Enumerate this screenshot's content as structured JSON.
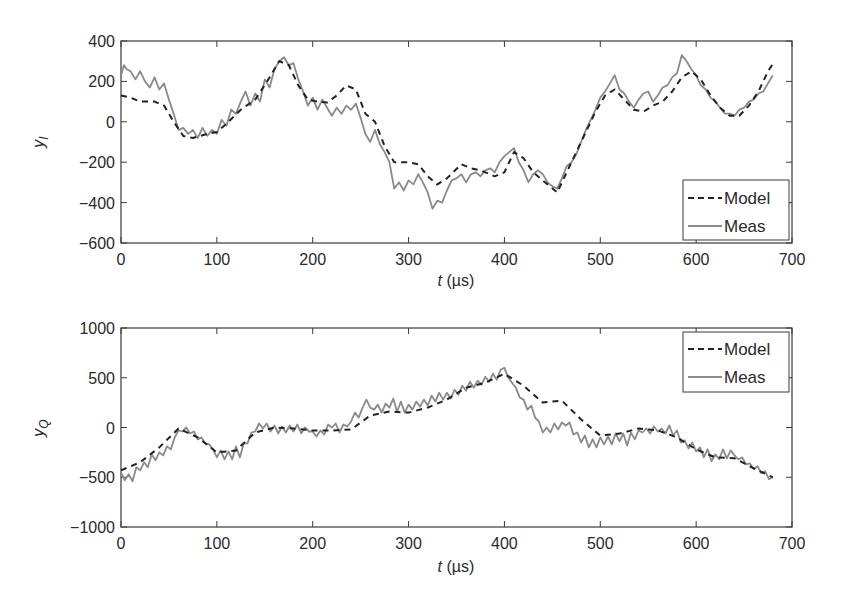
{
  "chart_data": [
    {
      "type": "line",
      "panel": "top",
      "title": "",
      "xlabel": "t (µs)",
      "xlabel_var": "t",
      "xlabel_unit": "(µs)",
      "ylabel": "y_I",
      "ylabel_main": "y",
      "ylabel_sub": "I",
      "xlim": [
        0,
        700
      ],
      "ylim": [
        -600,
        400
      ],
      "xticks": [
        0,
        100,
        200,
        300,
        400,
        500,
        600,
        700
      ],
      "yticks": [
        -600,
        -400,
        -200,
        0,
        200,
        400
      ],
      "xtick_labels": [
        "0",
        "100",
        "200",
        "300",
        "400",
        "500",
        "600",
        "700"
      ],
      "ytick_labels": [
        "−600",
        "−400",
        "−200",
        "0",
        "200",
        "400"
      ],
      "grid": false,
      "legend_position": "lower right",
      "legend": [
        "Model",
        "Meas"
      ],
      "series": [
        {
          "name": "Model",
          "style": "dashed",
          "color": "#222222",
          "x": [
            0,
            10,
            20,
            35,
            45,
            55,
            65,
            75,
            90,
            100,
            110,
            125,
            140,
            155,
            165,
            175,
            185,
            195,
            205,
            215,
            225,
            235,
            245,
            255,
            265,
            275,
            285,
            300,
            310,
            320,
            330,
            340,
            355,
            365,
            375,
            390,
            400,
            410,
            420,
            430,
            440,
            455,
            465,
            475,
            485,
            495,
            505,
            515,
            525,
            535,
            545,
            555,
            565,
            575,
            585,
            595,
            605,
            615,
            625,
            635,
            645,
            655,
            665,
            675,
            682
          ],
          "y": [
            130,
            120,
            100,
            100,
            80,
            0,
            -70,
            -80,
            -60,
            -50,
            -10,
            60,
            110,
            220,
            300,
            280,
            180,
            110,
            100,
            95,
            130,
            180,
            160,
            40,
            0,
            -120,
            -200,
            -200,
            -210,
            -270,
            -310,
            -280,
            -210,
            -230,
            -240,
            -270,
            -250,
            -150,
            -180,
            -250,
            -290,
            -350,
            -250,
            -150,
            -50,
            50,
            130,
            160,
            110,
            60,
            50,
            80,
            100,
            150,
            220,
            250,
            210,
            130,
            70,
            30,
            30,
            80,
            150,
            250,
            300
          ]
        },
        {
          "name": "Meas",
          "style": "solid",
          "color": "#8a8a8a",
          "x": [
            0,
            3,
            6,
            10,
            15,
            20,
            25,
            30,
            35,
            40,
            45,
            50,
            55,
            60,
            65,
            70,
            75,
            80,
            85,
            90,
            95,
            100,
            105,
            110,
            115,
            120,
            125,
            130,
            135,
            140,
            145,
            150,
            155,
            160,
            165,
            170,
            175,
            180,
            185,
            190,
            195,
            200,
            205,
            210,
            215,
            220,
            225,
            230,
            235,
            240,
            245,
            250,
            255,
            260,
            265,
            270,
            275,
            280,
            285,
            290,
            295,
            300,
            305,
            310,
            315,
            320,
            325,
            330,
            335,
            340,
            345,
            350,
            355,
            360,
            365,
            370,
            375,
            380,
            385,
            390,
            395,
            400,
            405,
            410,
            415,
            420,
            425,
            430,
            435,
            440,
            445,
            450,
            455,
            460,
            465,
            470,
            475,
            480,
            485,
            490,
            495,
            500,
            505,
            510,
            515,
            520,
            525,
            530,
            535,
            540,
            545,
            550,
            555,
            560,
            565,
            570,
            575,
            580,
            585,
            590,
            595,
            600,
            605,
            610,
            615,
            620,
            625,
            630,
            635,
            640,
            645,
            650,
            655,
            660,
            665,
            670,
            675,
            680
          ],
          "y": [
            230,
            280,
            260,
            250,
            210,
            250,
            200,
            170,
            220,
            160,
            190,
            110,
            40,
            -40,
            -30,
            -60,
            -40,
            -80,
            -30,
            -70,
            -40,
            -60,
            10,
            -20,
            60,
            40,
            100,
            150,
            80,
            140,
            100,
            210,
            170,
            260,
            300,
            320,
            280,
            290,
            210,
            150,
            80,
            120,
            60,
            110,
            70,
            30,
            70,
            40,
            80,
            60,
            90,
            20,
            -60,
            -100,
            -40,
            -110,
            -150,
            -200,
            -330,
            -300,
            -340,
            -290,
            -310,
            -260,
            -300,
            -350,
            -430,
            -390,
            -400,
            -340,
            -290,
            -280,
            -260,
            -300,
            -260,
            -250,
            -270,
            -240,
            -230,
            -250,
            -200,
            -170,
            -150,
            -130,
            -200,
            -240,
            -300,
            -260,
            -240,
            -260,
            -300,
            -320,
            -330,
            -280,
            -220,
            -200,
            -160,
            -100,
            -40,
            10,
            60,
            120,
            150,
            190,
            230,
            160,
            140,
            100,
            70,
            110,
            140,
            150,
            100,
            130,
            170,
            180,
            220,
            240,
            330,
            300,
            260,
            230,
            180,
            160,
            120,
            100,
            70,
            40,
            40,
            30,
            60,
            70,
            100,
            110,
            140,
            150,
            190,
            230
          ]
        }
      ]
    },
    {
      "type": "line",
      "panel": "bottom",
      "title": "",
      "xlabel": "t (µs)",
      "xlabel_var": "t",
      "xlabel_unit": "(µs)",
      "ylabel": "y_Q",
      "ylabel_main": "y",
      "ylabel_sub": "Q",
      "xlim": [
        0,
        700
      ],
      "ylim": [
        -1000,
        1000
      ],
      "xticks": [
        0,
        100,
        200,
        300,
        400,
        500,
        600,
        700
      ],
      "yticks": [
        -1000,
        -500,
        0,
        500,
        1000
      ],
      "xtick_labels": [
        "0",
        "100",
        "200",
        "300",
        "400",
        "500",
        "600",
        "700"
      ],
      "ytick_labels": [
        "−1000",
        "−500",
        "0",
        "500",
        "1000"
      ],
      "grid": false,
      "legend_position": "upper right",
      "legend": [
        "Model",
        "Meas"
      ],
      "series": [
        {
          "name": "Model",
          "style": "dashed",
          "color": "#222222",
          "x": [
            0,
            20,
            40,
            60,
            80,
            100,
            120,
            140,
            160,
            180,
            200,
            220,
            240,
            260,
            280,
            300,
            320,
            340,
            360,
            380,
            400,
            420,
            440,
            460,
            480,
            500,
            520,
            540,
            560,
            580,
            600,
            620,
            640,
            660,
            680
          ],
          "y": [
            -430,
            -350,
            -200,
            -10,
            -100,
            -250,
            -230,
            -50,
            0,
            -10,
            -30,
            -30,
            -20,
            120,
            160,
            150,
            200,
            280,
            400,
            450,
            540,
            420,
            250,
            270,
            80,
            -80,
            -60,
            -10,
            -30,
            -100,
            -220,
            -300,
            -310,
            -410,
            -500
          ],
          "x_range": [
            0,
            682
          ]
        },
        {
          "name": "Meas",
          "style": "solid",
          "color": "#8a8a8a",
          "x": [
            0,
            4,
            8,
            12,
            16,
            20,
            24,
            28,
            32,
            36,
            40,
            44,
            48,
            52,
            56,
            60,
            64,
            68,
            72,
            76,
            80,
            84,
            88,
            92,
            96,
            100,
            104,
            108,
            112,
            116,
            120,
            124,
            128,
            132,
            136,
            140,
            144,
            148,
            152,
            156,
            160,
            164,
            168,
            172,
            176,
            180,
            184,
            188,
            192,
            196,
            200,
            204,
            208,
            212,
            216,
            220,
            224,
            228,
            232,
            236,
            240,
            244,
            248,
            252,
            256,
            260,
            264,
            268,
            272,
            276,
            280,
            284,
            288,
            292,
            296,
            300,
            304,
            308,
            312,
            316,
            320,
            324,
            328,
            332,
            336,
            340,
            344,
            348,
            352,
            356,
            360,
            364,
            368,
            372,
            376,
            380,
            384,
            388,
            392,
            396,
            400,
            404,
            408,
            412,
            416,
            420,
            424,
            428,
            432,
            436,
            440,
            444,
            448,
            452,
            456,
            460,
            464,
            468,
            472,
            476,
            480,
            484,
            488,
            492,
            496,
            500,
            504,
            508,
            512,
            516,
            520,
            524,
            528,
            532,
            536,
            540,
            544,
            548,
            552,
            556,
            560,
            564,
            568,
            572,
            576,
            580,
            584,
            588,
            592,
            596,
            600,
            604,
            608,
            612,
            616,
            620,
            624,
            628,
            632,
            636,
            640,
            644,
            648,
            652,
            656,
            660,
            664,
            668,
            672,
            676,
            680
          ],
          "y": [
            -450,
            -530,
            -470,
            -540,
            -400,
            -430,
            -350,
            -400,
            -270,
            -330,
            -250,
            -280,
            -190,
            -220,
            -100,
            -30,
            -40,
            0,
            -60,
            -40,
            -120,
            -100,
            -160,
            -170,
            -220,
            -300,
            -230,
            -320,
            -240,
            -320,
            -190,
            -300,
            -160,
            -160,
            -50,
            -40,
            40,
            -10,
            40,
            -40,
            20,
            -60,
            10,
            -50,
            20,
            -40,
            30,
            -60,
            0,
            -40,
            -40,
            -90,
            -30,
            -70,
            30,
            0,
            40,
            -50,
            30,
            10,
            60,
            150,
            100,
            200,
            280,
            200,
            180,
            230,
            150,
            240,
            200,
            290,
            160,
            260,
            150,
            230,
            180,
            260,
            210,
            280,
            220,
            320,
            260,
            350,
            280,
            350,
            290,
            380,
            330,
            420,
            370,
            460,
            400,
            470,
            430,
            510,
            460,
            540,
            480,
            580,
            600,
            500,
            450,
            400,
            300,
            280,
            180,
            220,
            100,
            60,
            -50,
            0,
            -50,
            40,
            -20,
            50,
            20,
            50,
            -70,
            -50,
            -150,
            -80,
            -200,
            -120,
            -200,
            -100,
            -170,
            -90,
            -170,
            -60,
            -140,
            -60,
            -180,
            -50,
            -120,
            -30,
            -50,
            -10,
            -60,
            10,
            -40,
            -10,
            -60,
            20,
            -80,
            -30,
            -150,
            -130,
            -210,
            -150,
            -240,
            -200,
            -300,
            -220,
            -340,
            -270,
            -320,
            -220,
            -310,
            -230,
            -280,
            -320,
            -300,
            -370,
            -360,
            -420,
            -390,
            -460,
            -440,
            -520,
            -500
          ]
        }
      ]
    }
  ],
  "panels": {
    "top": {
      "ylabel_main": "y",
      "ylabel_sub": "I",
      "xlabel_var": "t",
      "xlabel_unit": "(µs)",
      "legend": {
        "model_label": "Model",
        "meas_label": "Meas"
      }
    },
    "bottom": {
      "ylabel_main": "y",
      "ylabel_sub": "Q",
      "xlabel_var": "t",
      "xlabel_unit": "(µs)",
      "legend": {
        "model_label": "Model",
        "meas_label": "Meas"
      }
    }
  },
  "colors": {
    "model_line": "#222222",
    "meas_line": "#8a8a8a",
    "axis": "#3a3a3a",
    "text": "#2a2a2a"
  }
}
